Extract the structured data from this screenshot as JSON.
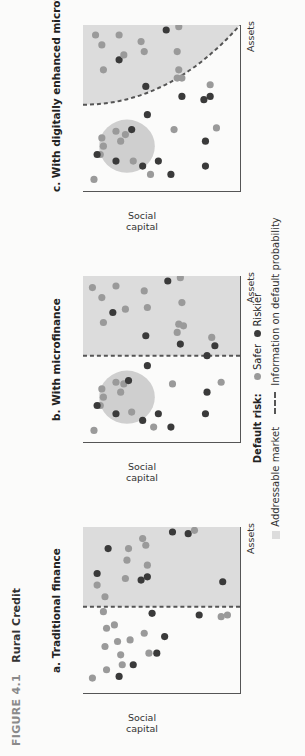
{
  "figure": {
    "number": "FIGURE 4.1",
    "title": "Rural Credit"
  },
  "colors": {
    "safer": "#9a9a9a",
    "riskier": "#3a3a3a",
    "addressable": "#dcdcdc",
    "cluster": "#cfcfcf",
    "axis": "#555555",
    "dash": "#555555"
  },
  "panels": [
    {
      "id": "a",
      "title": "a. Traditional finance",
      "xlabel": "Assets",
      "ylabel": "Social capital",
      "boundary": "vertical",
      "boundary_x": 0.52,
      "cluster": null,
      "points": [
        {
          "x": 0.09,
          "y": 0.06,
          "type": "safer"
        },
        {
          "x": 0.1,
          "y": 0.23,
          "type": "riskier"
        },
        {
          "x": 0.14,
          "y": 0.15,
          "type": "safer"
        },
        {
          "x": 0.17,
          "y": 0.32,
          "type": "riskier"
        },
        {
          "x": 0.17,
          "y": 0.25,
          "type": "safer"
        },
        {
          "x": 0.23,
          "y": 0.24,
          "type": "safer"
        },
        {
          "x": 0.24,
          "y": 0.42,
          "type": "safer"
        },
        {
          "x": 0.24,
          "y": 0.47,
          "type": "riskier"
        },
        {
          "x": 0.28,
          "y": 0.14,
          "type": "safer"
        },
        {
          "x": 0.31,
          "y": 0.22,
          "type": "safer"
        },
        {
          "x": 0.32,
          "y": 0.3,
          "type": "safer"
        },
        {
          "x": 0.34,
          "y": 0.52,
          "type": "riskier"
        },
        {
          "x": 0.36,
          "y": 0.39,
          "type": "safer"
        },
        {
          "x": 0.39,
          "y": 0.15,
          "type": "safer"
        },
        {
          "x": 0.41,
          "y": 0.2,
          "type": "safer"
        },
        {
          "x": 0.46,
          "y": 0.88,
          "type": "safer"
        },
        {
          "x": 0.48,
          "y": 0.44,
          "type": "riskier"
        },
        {
          "x": 0.49,
          "y": 0.13,
          "type": "safer"
        },
        {
          "x": 0.47,
          "y": 0.74,
          "type": "riskier"
        },
        {
          "x": 0.47,
          "y": 0.92,
          "type": "safer"
        },
        {
          "x": 0.58,
          "y": 0.14,
          "type": "safer"
        },
        {
          "x": 0.67,
          "y": 0.89,
          "type": "riskier"
        },
        {
          "x": 0.65,
          "y": 0.09,
          "type": "safer"
        },
        {
          "x": 0.68,
          "y": 0.37,
          "type": "riskier"
        },
        {
          "x": 0.69,
          "y": 0.27,
          "type": "safer"
        },
        {
          "x": 0.7,
          "y": 0.41,
          "type": "riskier"
        },
        {
          "x": 0.72,
          "y": 0.09,
          "type": "riskier"
        },
        {
          "x": 0.77,
          "y": 0.41,
          "type": "safer"
        },
        {
          "x": 0.8,
          "y": 0.28,
          "type": "safer"
        },
        {
          "x": 0.87,
          "y": 0.29,
          "type": "safer"
        },
        {
          "x": 0.87,
          "y": 0.16,
          "type": "riskier"
        },
        {
          "x": 0.89,
          "y": 0.4,
          "type": "safer"
        },
        {
          "x": 0.93,
          "y": 0.38,
          "type": "safer"
        },
        {
          "x": 0.96,
          "y": 0.67,
          "type": "riskier"
        },
        {
          "x": 0.97,
          "y": 0.57,
          "type": "riskier"
        },
        {
          "x": 0.98,
          "y": 0.71,
          "type": "safer"
        }
      ]
    },
    {
      "id": "b",
      "title": "b. With microfinance",
      "xlabel": "Assets",
      "ylabel": "Social capital",
      "boundary": "vertical",
      "boundary_x": 0.52,
      "cluster": {
        "cx": 0.27,
        "cy": 0.28,
        "r": 0.16
      },
      "points": [
        {
          "x": 0.07,
          "y": 0.07,
          "type": "safer"
        },
        {
          "x": 0.13,
          "y": 0.38,
          "type": "riskier"
        },
        {
          "x": 0.18,
          "y": 0.31,
          "type": "safer"
        },
        {
          "x": 0.22,
          "y": 0.11,
          "type": "safer"
        },
        {
          "x": 0.27,
          "y": 0.13,
          "type": "safer"
        },
        {
          "x": 0.3,
          "y": 0.24,
          "type": "safer"
        },
        {
          "x": 0.32,
          "y": 0.12,
          "type": "safer"
        },
        {
          "x": 0.35,
          "y": 0.26,
          "type": "safer"
        },
        {
          "x": 0.36,
          "y": 0.21,
          "type": "safer"
        },
        {
          "x": 0.17,
          "y": 0.21,
          "type": "riskier"
        },
        {
          "x": 0.22,
          "y": 0.09,
          "type": "riskier"
        },
        {
          "x": 0.09,
          "y": 0.45,
          "type": "safer"
        },
        {
          "x": 0.09,
          "y": 0.56,
          "type": "riskier"
        },
        {
          "x": 0.17,
          "y": 0.48,
          "type": "riskier"
        },
        {
          "x": 0.17,
          "y": 0.78,
          "type": "riskier"
        },
        {
          "x": 0.35,
          "y": 0.57,
          "type": "safer"
        },
        {
          "x": 0.3,
          "y": 0.79,
          "type": "riskier"
        },
        {
          "x": 0.37,
          "y": 0.29,
          "type": "riskier"
        },
        {
          "x": 0.36,
          "y": 0.88,
          "type": "safer"
        },
        {
          "x": 0.46,
          "y": 0.41,
          "type": "riskier"
        },
        {
          "x": 0.52,
          "y": 0.79,
          "type": "riskier"
        },
        {
          "x": 0.58,
          "y": 0.84,
          "type": "riskier"
        },
        {
          "x": 0.59,
          "y": 0.62,
          "type": "riskier"
        },
        {
          "x": 0.64,
          "y": 0.4,
          "type": "riskier"
        },
        {
          "x": 0.63,
          "y": 0.82,
          "type": "safer"
        },
        {
          "x": 0.66,
          "y": 0.6,
          "type": "safer"
        },
        {
          "x": 0.71,
          "y": 0.61,
          "type": "safer"
        },
        {
          "x": 0.7,
          "y": 0.64,
          "type": "safer"
        },
        {
          "x": 0.78,
          "y": 0.19,
          "type": "riskier"
        },
        {
          "x": 0.72,
          "y": 0.13,
          "type": "safer"
        },
        {
          "x": 0.8,
          "y": 0.27,
          "type": "safer"
        },
        {
          "x": 0.81,
          "y": 0.41,
          "type": "safer"
        },
        {
          "x": 0.84,
          "y": 0.63,
          "type": "safer"
        },
        {
          "x": 0.87,
          "y": 0.12,
          "type": "safer"
        },
        {
          "x": 0.91,
          "y": 0.39,
          "type": "safer"
        },
        {
          "x": 0.93,
          "y": 0.06,
          "type": "safer"
        },
        {
          "x": 0.94,
          "y": 0.21,
          "type": "safer"
        },
        {
          "x": 0.97,
          "y": 0.54,
          "type": "riskier"
        },
        {
          "x": 0.99,
          "y": 0.62,
          "type": "safer"
        }
      ]
    },
    {
      "id": "c",
      "title": "c. With digitally enhanced microfinance",
      "xlabel": "Assets",
      "ylabel": "Social capital",
      "boundary": "curve",
      "cluster": {
        "cx": 0.27,
        "cy": 0.28,
        "r": 0.16
      },
      "points": [
        {
          "x": 0.07,
          "y": 0.07,
          "type": "safer"
        },
        {
          "x": 0.15,
          "y": 0.38,
          "type": "riskier"
        },
        {
          "x": 0.18,
          "y": 0.32,
          "type": "safer"
        },
        {
          "x": 0.22,
          "y": 0.11,
          "type": "safer"
        },
        {
          "x": 0.27,
          "y": 0.13,
          "type": "safer"
        },
        {
          "x": 0.3,
          "y": 0.24,
          "type": "safer"
        },
        {
          "x": 0.32,
          "y": 0.12,
          "type": "safer"
        },
        {
          "x": 0.34,
          "y": 0.27,
          "type": "safer"
        },
        {
          "x": 0.36,
          "y": 0.21,
          "type": "safer"
        },
        {
          "x": 0.18,
          "y": 0.21,
          "type": "riskier"
        },
        {
          "x": 0.22,
          "y": 0.09,
          "type": "riskier"
        },
        {
          "x": 0.1,
          "y": 0.43,
          "type": "safer"
        },
        {
          "x": 0.1,
          "y": 0.56,
          "type": "riskier"
        },
        {
          "x": 0.18,
          "y": 0.48,
          "type": "riskier"
        },
        {
          "x": 0.15,
          "y": 0.78,
          "type": "riskier"
        },
        {
          "x": 0.37,
          "y": 0.58,
          "type": "safer"
        },
        {
          "x": 0.3,
          "y": 0.78,
          "type": "riskier"
        },
        {
          "x": 0.37,
          "y": 0.31,
          "type": "riskier"
        },
        {
          "x": 0.38,
          "y": 0.85,
          "type": "safer"
        },
        {
          "x": 0.46,
          "y": 0.41,
          "type": "riskier"
        },
        {
          "x": 0.55,
          "y": 0.77,
          "type": "riskier"
        },
        {
          "x": 0.57,
          "y": 0.81,
          "type": "riskier"
        },
        {
          "x": 0.57,
          "y": 0.63,
          "type": "riskier"
        },
        {
          "x": 0.63,
          "y": 0.4,
          "type": "riskier"
        },
        {
          "x": 0.64,
          "y": 0.81,
          "type": "safer"
        },
        {
          "x": 0.68,
          "y": 0.6,
          "type": "safer"
        },
        {
          "x": 0.68,
          "y": 0.63,
          "type": "safer"
        },
        {
          "x": 0.73,
          "y": 0.61,
          "type": "safer"
        },
        {
          "x": 0.79,
          "y": 0.23,
          "type": "riskier"
        },
        {
          "x": 0.73,
          "y": 0.13,
          "type": "safer"
        },
        {
          "x": 0.82,
          "y": 0.26,
          "type": "safer"
        },
        {
          "x": 0.84,
          "y": 0.39,
          "type": "safer"
        },
        {
          "x": 0.84,
          "y": 0.6,
          "type": "safer"
        },
        {
          "x": 0.88,
          "y": 0.12,
          "type": "safer"
        },
        {
          "x": 0.9,
          "y": 0.37,
          "type": "safer"
        },
        {
          "x": 0.94,
          "y": 0.08,
          "type": "safer"
        },
        {
          "x": 0.94,
          "y": 0.23,
          "type": "safer"
        },
        {
          "x": 0.97,
          "y": 0.53,
          "type": "riskier"
        },
        {
          "x": 0.99,
          "y": 0.61,
          "type": "safer"
        }
      ]
    }
  ],
  "legend": {
    "default_risk_label": "Default risk:",
    "safer_label": "Safer",
    "riskier_label": "Riskier",
    "addressable_label": "Addressable market",
    "info_label": "Information on default probability"
  }
}
